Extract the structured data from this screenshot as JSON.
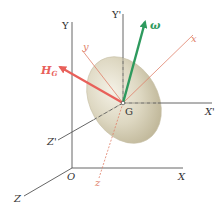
{
  "diagram": {
    "title": "",
    "colors": {
      "fixed_axes": "#555555",
      "body_axes": "#e0806a",
      "angular_momentum": "#e8605a",
      "angular_velocity": "#2e9a5e",
      "ellipsoid_fill": "#d9d3bd",
      "ellipsoid_edge": "#c8c0a6"
    },
    "points": {
      "origin": {
        "label": "O"
      },
      "center_of_mass": {
        "label": "G"
      }
    },
    "fixed_axes": {
      "x": {
        "label": "X"
      },
      "y": {
        "label": "Y"
      },
      "z": {
        "label": "Z"
      }
    },
    "translating_axes": {
      "x": {
        "label": "X'"
      },
      "y": {
        "label": "Y'"
      },
      "z": {
        "label": "Z'"
      }
    },
    "body_axes": {
      "x": {
        "label": "x"
      },
      "y": {
        "label": "y"
      },
      "z": {
        "label": "z"
      }
    },
    "vectors": {
      "angular_momentum": {
        "label": "H",
        "subscript": "G"
      },
      "angular_velocity": {
        "label": "ω"
      }
    }
  }
}
